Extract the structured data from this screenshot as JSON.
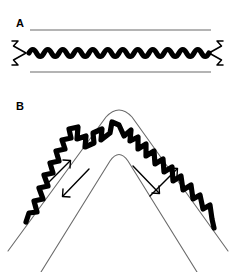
{
  "figure": {
    "background_color": "#ffffff",
    "ink_color": "#000000",
    "rail_color": "#6b6b6b",
    "width": 235,
    "height": 272
  },
  "panels": [
    {
      "id": "A",
      "label": "A",
      "label_x": 16,
      "label_y": 18,
      "description": "Straight horizontal wavy filament confined between two parallel rails, with outward-pointing chevron arrowheads at both ends",
      "rails": [
        {
          "name": "upper-rail",
          "x1": 30,
          "y1": 30,
          "x2": 211,
          "y2": 30
        },
        {
          "name": "lower-rail",
          "x1": 30,
          "y1": 72,
          "x2": 211,
          "y2": 72
        }
      ],
      "wave": {
        "x_start": 29,
        "x_end": 210,
        "y_center": 53,
        "amplitude": 7,
        "periods": 12,
        "stroke_width": 5.2
      },
      "end_markers": [
        {
          "name": "left-chevron-arrow",
          "x": 16,
          "y": 51,
          "direction": "left"
        },
        {
          "name": "right-chevron-arrow",
          "x": 219,
          "y": 51,
          "direction": "right"
        }
      ]
    },
    {
      "id": "B",
      "label": "B",
      "label_x": 16,
      "label_y": 100,
      "description": "Same wavy filament bent into an inverted-V (chevron) fold between two bent rails, with four diagonal flow arrows on the limbs",
      "apex": {
        "x": 119,
        "y": 112
      },
      "rails": [
        {
          "name": "outer-rail",
          "apex_x": 119,
          "apex_y": 106,
          "left_end_x": 8,
          "left_end_y": 250,
          "right_end_x": 228,
          "right_end_y": 250,
          "corner_radius": 20
        },
        {
          "name": "inner-rail",
          "apex_x": 119,
          "apex_y": 152,
          "left_end_x": 40,
          "left_end_y": 272,
          "right_end_x": 198,
          "right_end_y": 272,
          "corner_radius": 16
        }
      ],
      "wave": {
        "apex_x": 119,
        "apex_y": 125,
        "left_end_x": 26,
        "left_end_y": 222,
        "right_end_x": 214,
        "right_end_y": 250,
        "amplitude": 7,
        "periods_per_limb": 8,
        "stroke_width": 5.2
      },
      "flow_arrows": [
        {
          "name": "flow-arrow-left-upward",
          "x1": 47,
          "y1": 183,
          "x2": 70,
          "y2": 161,
          "points": "up-right"
        },
        {
          "name": "flow-arrow-left-downward",
          "x1": 88,
          "y1": 170,
          "x2": 62,
          "y2": 196,
          "points": "down-left"
        },
        {
          "name": "flow-arrow-right-upward",
          "x1": 150,
          "y1": 196,
          "x2": 176,
          "y2": 169,
          "points": "up-right"
        },
        {
          "name": "flow-arrow-right-downward",
          "x1": 133,
          "y1": 166,
          "x2": 158,
          "y2": 192,
          "points": "down-right"
        }
      ]
    }
  ],
  "caption": {
    "partial_text": "",
    "visible": false
  }
}
